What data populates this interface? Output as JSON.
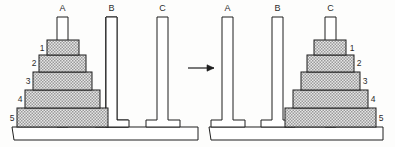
{
  "figure": {
    "type": "tower-of-hanoi",
    "caption": "",
    "disk_count": 5,
    "transition_arrow": "right-arrow"
  },
  "panels": [
    {
      "id": "initial-state",
      "pegs": [
        {
          "label": "A",
          "occupied": true
        },
        {
          "label": "B",
          "occupied": false
        },
        {
          "label": "C",
          "occupied": false
        }
      ],
      "stack_peg": "A",
      "label_side": "left",
      "disks": [
        {
          "label": "1",
          "size": 1
        },
        {
          "label": "2",
          "size": 2
        },
        {
          "label": "3",
          "size": 3
        },
        {
          "label": "4",
          "size": 4
        },
        {
          "label": "5",
          "size": 5
        }
      ]
    },
    {
      "id": "goal-state",
      "pegs": [
        {
          "label": "A",
          "occupied": false
        },
        {
          "label": "B",
          "occupied": false
        },
        {
          "label": "C",
          "occupied": true
        }
      ],
      "stack_peg": "C",
      "label_side": "right",
      "disks": [
        {
          "label": "1",
          "size": 1
        },
        {
          "label": "2",
          "size": 2
        },
        {
          "label": "3",
          "size": 3
        },
        {
          "label": "4",
          "size": 4
        },
        {
          "label": "5",
          "size": 5
        }
      ]
    }
  ],
  "colors": {
    "stroke": "#1f1f1f",
    "disk_fill": "#d8d8d8",
    "background": "#fdfdfc",
    "peg_fill": "#ffffff"
  }
}
